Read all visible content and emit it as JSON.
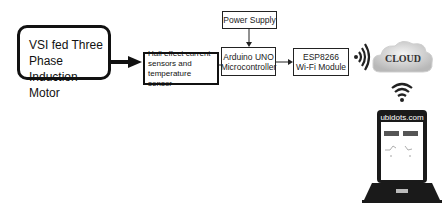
{
  "diagram": {
    "blocks": {
      "motor": "VSI fed Three Phase Induction Motor",
      "motor_lines": [
        "VSI fed Three",
        "Phase Induction",
        "Motor"
      ],
      "sensor_lines": [
        "Hall effect current",
        "sensors and",
        "temperature sensor"
      ],
      "arduino_lines": [
        "Arduino UNO",
        "Microcontroller"
      ],
      "power": "Power Supply",
      "esp_lines": [
        "ESP8266",
        "Wi-Fi Module"
      ],
      "cloud": "CLOUD",
      "laptop_site": "ubidots.com"
    },
    "edges": [
      {
        "from": "VSI fed Three Phase Induction Motor",
        "to": "Hall effect current sensors and temperature sensor"
      },
      {
        "from": "Hall effect current sensors and temperature sensor",
        "to": "Arduino UNO Microcontroller"
      },
      {
        "from": "Power Supply",
        "to": "Arduino UNO Microcontroller"
      },
      {
        "from": "Arduino UNO Microcontroller",
        "to": "ESP8266 Wi-Fi Module"
      },
      {
        "from": "ESP8266 Wi-Fi Module",
        "to": "CLOUD",
        "type": "wireless"
      },
      {
        "from": "CLOUD",
        "to": "ubidots.com",
        "type": "wireless"
      }
    ]
  }
}
